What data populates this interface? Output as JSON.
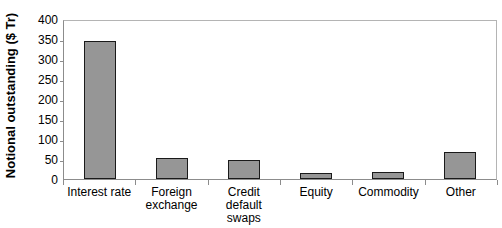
{
  "chart_data": {
    "type": "bar",
    "title": "",
    "xlabel": "",
    "ylabel": "Notional outstanding ($ Tr)",
    "categories": [
      "Interest rate",
      "Foreign exchange",
      "Credit default swaps",
      "Equity",
      "Commodity",
      "Other"
    ],
    "values": [
      345,
      52,
      47,
      15,
      18,
      67
    ],
    "ylim": [
      0,
      400
    ],
    "ytick_labels": [
      "400",
      "350",
      "300",
      "250",
      "200",
      "150",
      "100",
      "50",
      "0"
    ],
    "ytick_values": [
      400,
      350,
      300,
      250,
      200,
      150,
      100,
      50,
      0
    ],
    "grid": false,
    "legend": false,
    "bar_fill_color": "#969696",
    "bar_border_color": "#1a1a1a",
    "axis_color": "#8c8c8c",
    "plot_border_color": "#b4b4b4",
    "background_color": "#ffffff"
  }
}
